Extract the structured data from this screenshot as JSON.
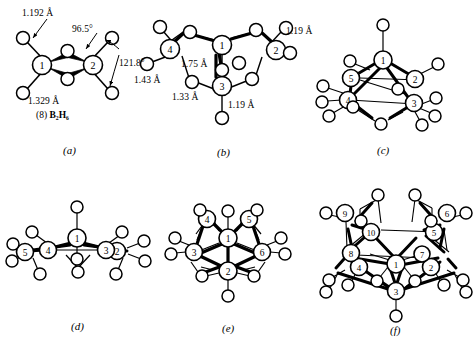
{
  "figure": {
    "background": "#ffffff",
    "ink": "#000000"
  },
  "panels": [
    {
      "id": "a",
      "caption": "(a)",
      "formula_prefix": "(8)",
      "formula": "B2H6",
      "formula_display": "B₂H₆",
      "vertices": [
        "1",
        "2"
      ],
      "labels": [
        {
          "text": "1.192 Å",
          "kind": "bond-length"
        },
        {
          "text": "1.329 Å",
          "kind": "bond-length"
        },
        {
          "text": "96.5°",
          "kind": "bond-angle"
        },
        {
          "text": "121.8°",
          "kind": "bond-angle"
        }
      ]
    },
    {
      "id": "b",
      "caption": "(b)",
      "vertices": [
        "1",
        "2",
        "3",
        "4"
      ],
      "labels": [
        {
          "text": "1.19 Å",
          "kind": "bond-length"
        },
        {
          "text": "1.75 Å",
          "kind": "bond-length"
        },
        {
          "text": "1.43 Å",
          "kind": "bond-length"
        },
        {
          "text": "1.33 Å",
          "kind": "bond-length"
        },
        {
          "text": "1.19 Å",
          "kind": "bond-length"
        }
      ]
    },
    {
      "id": "c",
      "caption": "(c)",
      "vertices": [
        "1",
        "2",
        "3",
        "4",
        "5"
      ],
      "labels": []
    },
    {
      "id": "d",
      "caption": "(d)",
      "vertices": [
        "1",
        "2",
        "3",
        "4",
        "5"
      ],
      "labels": []
    },
    {
      "id": "e",
      "caption": "(e)",
      "vertices": [
        "1",
        "2",
        "3",
        "4",
        "5",
        "6"
      ],
      "labels": []
    },
    {
      "id": "f",
      "caption": "(f)",
      "vertices": [
        "1",
        "2",
        "3",
        "4",
        "5",
        "6",
        "7",
        "8",
        "9",
        "10"
      ],
      "labels": []
    }
  ],
  "text_items": {
    "a_len_top": "1.192 Å",
    "a_len_bottom": "1.329 Å",
    "a_ang_left": "96.5°",
    "a_ang_right": "121.8°",
    "a_formula_pre": "(8)",
    "a_formula": "B₂H₆",
    "b_len_right": "1.19 Å",
    "b_len_mid": "1.75 Å",
    "b_len_left": "1.43 Å",
    "b_len_lower": "1.33 Å",
    "b_len_bottom": "1.19 Å",
    "cap_a": "(a)",
    "cap_b": "(b)",
    "cap_c": "(c)",
    "cap_d": "(d)",
    "cap_e": "(e)",
    "cap_f": "(f)"
  }
}
